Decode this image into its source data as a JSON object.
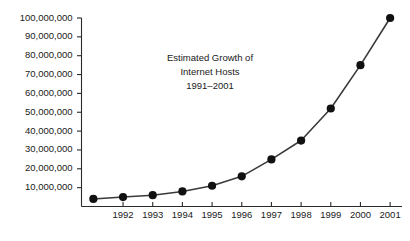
{
  "chart_data": {
    "type": "line",
    "title_lines": [
      "Estimated Growth of",
      "Internet Hosts",
      "1991–2001"
    ],
    "xlabel": "",
    "ylabel": "",
    "x": [
      1991,
      1992,
      1993,
      1994,
      1995,
      1996,
      1997,
      1998,
      1999,
      2000,
      2001
    ],
    "values": [
      4000000,
      5000000,
      6000000,
      8000000,
      11000000,
      16000000,
      25000000,
      35000000,
      52000000,
      75000000,
      100000000
    ],
    "categories": [
      "1991",
      "1992",
      "1993",
      "1994",
      "1995",
      "1996",
      "1997",
      "1998",
      "1999",
      "2000",
      "2001"
    ],
    "xtick_labels": [
      "1992",
      "1993",
      "1994",
      "1995",
      "1996",
      "1997",
      "1998",
      "1999",
      "2000",
      "2001"
    ],
    "xtick_values": [
      1992,
      1993,
      1994,
      1995,
      1996,
      1997,
      1998,
      1999,
      2000,
      2001
    ],
    "ytick_labels": [
      "10,000,000",
      "20,000,000",
      "30,000,000",
      "40,000,000",
      "50,000,000",
      "60,000,000",
      "70,000,000",
      "80,000,000",
      "90,000,000",
      "100,000,000"
    ],
    "ytick_values": [
      10000000,
      20000000,
      30000000,
      40000000,
      50000000,
      60000000,
      70000000,
      80000000,
      90000000,
      100000000
    ],
    "ylim": [
      0,
      100000000
    ],
    "xlim": [
      1990.6,
      2001.4
    ],
    "grid": false,
    "legend": null,
    "marker": "circle",
    "line_color": "#3a3a3a",
    "marker_color": "#111111",
    "axis_color": "#2b2b2b",
    "text_color": "#1a1a1a",
    "background_color": "#ffffff"
  }
}
